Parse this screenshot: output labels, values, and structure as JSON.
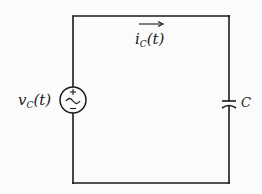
{
  "diagram": {
    "type": "circuit",
    "title": "",
    "colors": {
      "wire": "#1a1a1a",
      "background": "#fbfbfb",
      "text": "#222222"
    },
    "source": {
      "kind": "ac-voltage-source",
      "label_main": "v",
      "label_sub": "C",
      "label_tail": "(t)",
      "plus_sign": "+",
      "minus_sign": "−"
    },
    "current": {
      "direction": "right",
      "label_main": "i",
      "label_sub": "C",
      "label_tail": "(t)"
    },
    "capacitor": {
      "label": "C"
    }
  }
}
